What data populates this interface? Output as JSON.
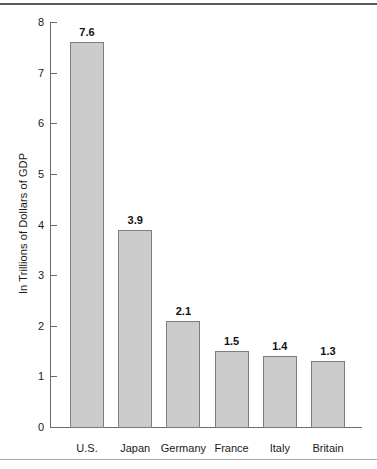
{
  "chart_data": {
    "type": "bar",
    "title": "",
    "xlabel": "",
    "ylabel": "In Trillions of Dollars of GDP",
    "categories": [
      "U.S.",
      "Japan",
      "Germany",
      "France",
      "Italy",
      "Britain"
    ],
    "values": [
      7.6,
      3.9,
      2.1,
      1.5,
      1.4,
      1.3
    ],
    "value_labels": [
      "7.6",
      "3.9",
      "2.1",
      "1.5",
      "1.4",
      "1.3"
    ],
    "ylim": [
      0,
      8
    ],
    "ytick_labels": [
      "0",
      "1",
      "2",
      "3",
      "4",
      "5",
      "6",
      "7",
      "8"
    ],
    "ytick_values": [
      0,
      1,
      2,
      3,
      4,
      5,
      6,
      7,
      8
    ],
    "grid": false,
    "legend": null,
    "bar_fill_color": "#cccccc",
    "bar_edge_color": "#7d7d7d",
    "axis_color": "#6b6b6b",
    "text_color": "#1a1a1a",
    "background_color": "#ffffff"
  }
}
